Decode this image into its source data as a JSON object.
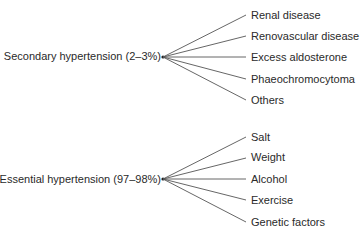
{
  "groups": [
    {
      "label": "Secondary hypertension (2–3%)",
      "items": [
        "Renal disease",
        "Renovascular disease",
        "Excess aldosterone",
        "Phaeochromocytoma",
        "Others"
      ]
    },
    {
      "label": "Essential hypertension (97–98%)",
      "items": [
        "Salt",
        "Weight",
        "Alcohol",
        "Exercise",
        "Genetic factors"
      ]
    }
  ],
  "colors": {
    "line": "#555555",
    "text": "#2a2a2a"
  }
}
